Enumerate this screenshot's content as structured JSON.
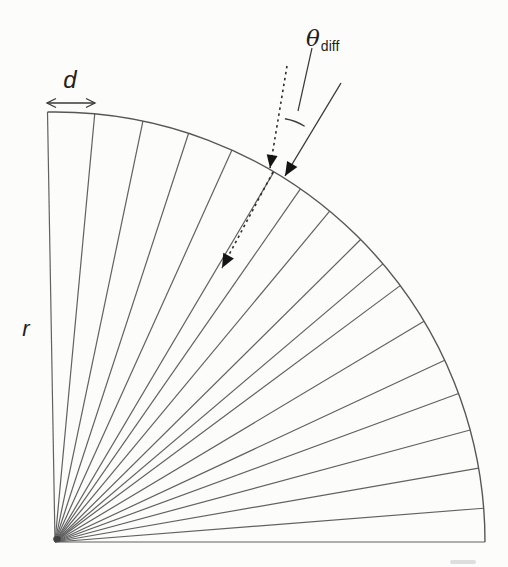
{
  "figure": {
    "labels": {
      "groove_spacing": "d",
      "radius": "r",
      "theta": "θ",
      "theta_sub": "diff"
    },
    "colors": {
      "background": "#fcfcfb",
      "groove_ink": "#616161",
      "arc_ink": "#575757",
      "ray_ink": "#3a3a3a",
      "dash_ink": "#2e2e2e",
      "arrowhead_ink": "#141414",
      "label_ink": "#1f1f1f"
    },
    "geometry": {
      "canvas": [
        508,
        567
      ],
      "fan_center": [
        55,
        542
      ],
      "fan_radius": 430,
      "groove_angles_deg": [
        91,
        84.7,
        78.2,
        71.9,
        65.7,
        59.4,
        55.2,
        50.3,
        44.7,
        40.3,
        36.6,
        30.9,
        25.0,
        20.2,
        15.1,
        9.9,
        4.5,
        0
      ],
      "arc_start_deg": 91,
      "arc_end_deg": 0,
      "d_arrow": {
        "x1": 47,
        "x2": 95,
        "y": 103
      },
      "dashed_incident_ray": {
        "from": [
          287,
          66
        ],
        "to": [
          270,
          168
        ]
      },
      "solid_ray": {
        "from": [
          341,
          83
        ],
        "to": [
          285,
          176
        ]
      },
      "inner_dashed_ray": {
        "from": [
          273,
          172
        ],
        "to": [
          222,
          268
        ]
      },
      "angle_arc": {
        "center": [
          276,
          172
        ],
        "radius": 54,
        "start_deg_from_up": 9.5,
        "end_deg_from_up": 32
      },
      "leader_line": {
        "from": [
          312,
          48
        ],
        "to": [
          298,
          111
        ]
      },
      "origin_blob": {
        "at": [
          57,
          539
        ],
        "rx": 4,
        "ry": 3
      },
      "scan_smudge": {
        "x": 450,
        "y": 560,
        "w": 26,
        "h": 4
      }
    }
  }
}
